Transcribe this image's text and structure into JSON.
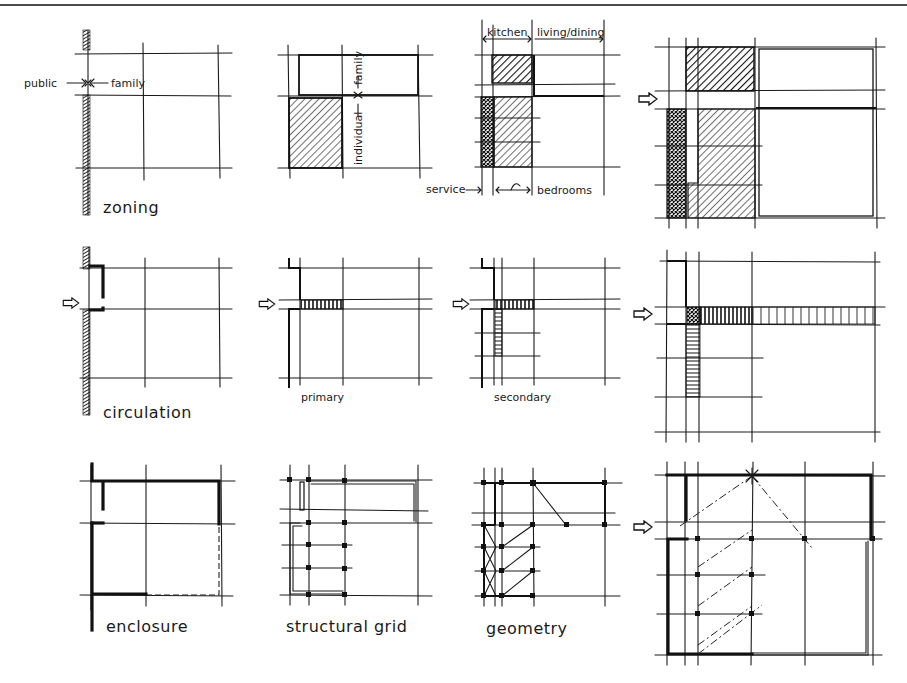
{
  "colors": {
    "ink": "#1a1a1a",
    "paper": "#ffffff"
  },
  "rows": [
    {
      "name": "zoning-row",
      "panels": [
        {
          "label": "zoning",
          "annotations": {
            "left": "public",
            "right": "family"
          }
        },
        {
          "label": "",
          "annotations": {
            "upper": "family",
            "lower": "individual"
          }
        },
        {
          "label": "",
          "annotations": {
            "top_left": "kitchen",
            "top_right": "living/dining",
            "bottom_left": "service",
            "bottom_right": "bedrooms"
          }
        },
        {
          "label": "",
          "entry_icon": "arrow-right-icon"
        }
      ]
    },
    {
      "name": "circulation-row",
      "panels": [
        {
          "label": "circulation",
          "entry_icon": "arrow-right-icon"
        },
        {
          "label": "primary",
          "entry_icon": "arrow-right-icon"
        },
        {
          "label": "secondary",
          "entry_icon": "arrow-right-icon"
        },
        {
          "label": "",
          "entry_icon": "arrow-right-icon"
        }
      ]
    },
    {
      "name": "enclosure-row",
      "panels": [
        {
          "label": "enclosure"
        },
        {
          "label": "structural grid"
        },
        {
          "label": "geometry"
        },
        {
          "label": "",
          "entry_icon": "arrow-right-icon"
        }
      ]
    }
  ]
}
